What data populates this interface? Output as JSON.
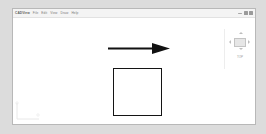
{
  "window": {
    "title": "Untitled - CAD Viewer"
  },
  "menubar": {
    "app_name": "CADView",
    "items": [
      {
        "label": "File"
      },
      {
        "label": "Edit"
      },
      {
        "label": "View"
      },
      {
        "label": "Draw"
      },
      {
        "label": "Help"
      }
    ]
  },
  "window_controls": [
    {
      "icon": "minimize-icon"
    },
    {
      "icon": "maximize-icon"
    },
    {
      "icon": "close-icon"
    }
  ],
  "nav_panel": {
    "viewcube": {
      "icon": "view-cube-icon",
      "arrows": [
        {
          "direction": "up",
          "icon": "arrow-up-icon"
        },
        {
          "direction": "down",
          "icon": "arrow-down-icon"
        },
        {
          "direction": "left",
          "icon": "arrow-left-icon"
        },
        {
          "direction": "right",
          "icon": "arrow-right-icon"
        }
      ]
    },
    "label": "TOP"
  },
  "canvas": {
    "background": "#ffffff",
    "axis_indicator": {
      "icon": "axis-origin-icon",
      "x_label": "X",
      "y_label": "Y"
    },
    "shapes": [
      {
        "name": "arrow",
        "type": "arrow",
        "direction": "right",
        "color": "#111111",
        "x": 95,
        "y": 23,
        "width": 62,
        "height": 13
      },
      {
        "name": "square",
        "type": "rectangle",
        "fill": "none",
        "stroke": "#141414",
        "stroke_width": 1.6,
        "x": 100,
        "y": 50,
        "width": 49,
        "height": 48
      }
    ]
  }
}
